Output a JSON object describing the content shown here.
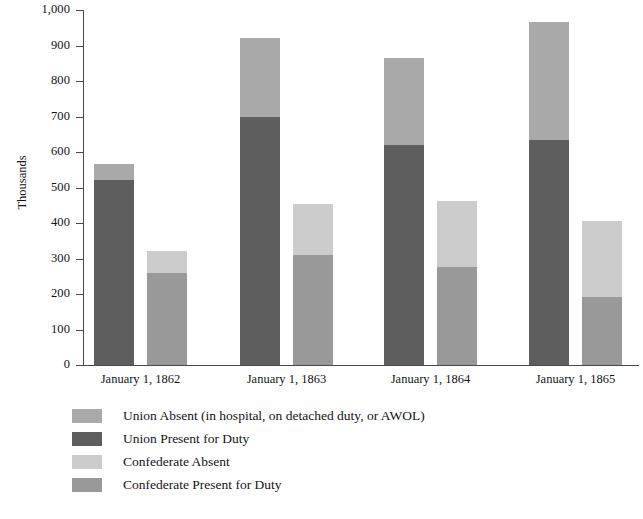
{
  "chart_data": {
    "type": "bar",
    "subtype": "grouped-stacked",
    "title": "",
    "xlabel": "",
    "ylabel": "Thousands",
    "ylim": [
      0,
      1000
    ],
    "yticks": [
      0,
      100,
      200,
      300,
      400,
      500,
      600,
      700,
      800,
      900,
      1000
    ],
    "ytick_labels": [
      "0",
      "100",
      "200",
      "300",
      "400",
      "500",
      "600",
      "700",
      "800",
      "900",
      "1,000"
    ],
    "grid": false,
    "legend_position": "below-plot-left",
    "categories": [
      "January 1, 1862",
      "January 1, 1863",
      "January 1, 1864",
      "January 1, 1865"
    ],
    "series": [
      {
        "name": "Union Present for Duty",
        "group": "Union",
        "stack_part": "present",
        "color": "#5e5e5e",
        "values": [
          520,
          700,
          620,
          635
        ]
      },
      {
        "name": "Union Absent (in hospital, on detached duty, or AWOL)",
        "group": "Union",
        "stack_part": "absent",
        "color": "#a9a9a9",
        "values": [
          45,
          220,
          245,
          330
        ]
      },
      {
        "name": "Confederate Present for Duty",
        "group": "Confederate",
        "stack_part": "present",
        "color": "#999999",
        "values": [
          260,
          310,
          277,
          192
        ]
      },
      {
        "name": "Confederate Absent",
        "group": "Confederate",
        "stack_part": "absent",
        "color": "#cccccc",
        "values": [
          62,
          143,
          186,
          213
        ]
      }
    ],
    "totals": {
      "Union": [
        565,
        920,
        865,
        965
      ],
      "Confederate": [
        322,
        453,
        463,
        405
      ]
    }
  },
  "legend": {
    "items": [
      {
        "label": "Union Absent (in hospital, on detached duty, or AWOL)",
        "color": "#a9a9a9"
      },
      {
        "label": "Union Present for Duty",
        "color": "#5e5e5e"
      },
      {
        "label": "Confederate Absent",
        "color": "#cccccc"
      },
      {
        "label": "Confederate Present for Duty",
        "color": "#999999"
      }
    ]
  }
}
